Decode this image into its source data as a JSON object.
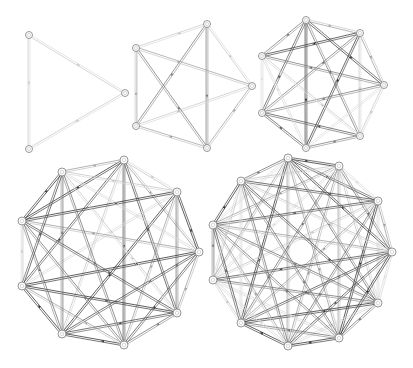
{
  "figure": {
    "graphs": [
      {
        "name": "K3",
        "node_radius": 3.5,
        "nodes": [
          [
            29,
            35
          ],
          [
            125,
            93
          ],
          [
            29,
            149
          ]
        ]
      },
      {
        "name": "K5",
        "node_radius": 3.5,
        "nodes": [
          [
            207,
            24
          ],
          [
            252,
            86
          ],
          [
            207,
            148
          ],
          [
            136,
            126
          ],
          [
            136,
            48
          ]
        ]
      },
      {
        "name": "K7",
        "node_radius": 3.5,
        "nodes": [
          [
            306,
            20
          ],
          [
            360,
            33
          ],
          [
            384,
            85
          ],
          [
            360,
            136
          ],
          [
            306,
            148
          ],
          [
            262,
            113
          ],
          [
            262,
            56
          ]
        ]
      },
      {
        "name": "K9",
        "node_radius": 4,
        "nodes": [
          [
            124,
            160
          ],
          [
            177,
            192
          ],
          [
            199,
            252
          ],
          [
            177,
            313
          ],
          [
            124,
            345
          ],
          [
            62,
            334
          ],
          [
            22,
            286
          ],
          [
            22,
            221
          ],
          [
            62,
            172
          ]
        ]
      },
      {
        "name": "K11",
        "node_radius": 4,
        "nodes": [
          [
            288,
            158
          ],
          [
            339,
            166
          ],
          [
            378,
            201
          ],
          [
            392,
            252
          ],
          [
            378,
            303
          ],
          [
            339,
            338
          ],
          [
            288,
            346
          ],
          [
            241,
            323
          ],
          [
            213,
            280
          ],
          [
            213,
            225
          ],
          [
            241,
            181
          ]
        ]
      }
    ],
    "edge_colors": [
      "#2b2b2b",
      "#4a4a4a",
      "#6e6e6e",
      "#9a9a9a",
      "#c4c4c4",
      "#dadada"
    ],
    "node_stroke": "#8a8a8a",
    "background": "#ffffff"
  }
}
